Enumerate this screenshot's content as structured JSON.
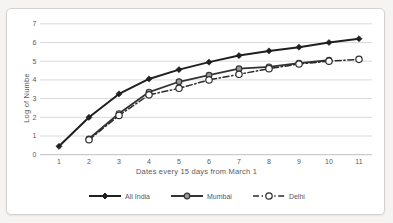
{
  "chart_data": {
    "type": "line",
    "title": "",
    "xlabel": "Dates every 15 days from March 1",
    "ylabel": "Log of Numbe",
    "x_ticks": [
      1,
      2,
      3,
      4,
      5,
      6,
      7,
      8,
      9,
      10,
      11
    ],
    "y_ticks": [
      0,
      1,
      2,
      3,
      4,
      5,
      6,
      7
    ],
    "xlim": [
      1,
      11
    ],
    "ylim": [
      0,
      7
    ],
    "grid": "horizontal",
    "legend_position": "bottom",
    "categories": [
      1,
      2,
      3,
      4,
      5,
      6,
      7,
      8,
      9,
      10,
      11
    ],
    "series": [
      {
        "name": "All India",
        "marker": "diamond",
        "line_style": "solid",
        "color": "#1f1f1f",
        "marker_fill": "#1f1f1f",
        "values": [
          0.45,
          2.0,
          3.25,
          4.05,
          4.55,
          4.95,
          5.3,
          5.55,
          5.75,
          6.0,
          6.2
        ]
      },
      {
        "name": "Mumbai",
        "marker": "circle",
        "line_style": "solid",
        "color": "#333333",
        "marker_fill": "#999999",
        "values": [
          null,
          0.85,
          2.2,
          3.35,
          3.9,
          4.25,
          4.6,
          4.7,
          4.9,
          5.05,
          null
        ]
      },
      {
        "name": "Delhi",
        "marker": "open-circle",
        "line_style": "dash-dot",
        "color": "#2b2b2b",
        "marker_fill": "#ffffff",
        "values": [
          null,
          0.8,
          2.1,
          3.2,
          3.55,
          4.0,
          4.3,
          4.6,
          4.85,
          5.0,
          5.1
        ]
      }
    ],
    "colors": {
      "gridline": "#d9d9d9",
      "axis_line": "#c1bfbf",
      "tick_text": "#595959"
    }
  }
}
